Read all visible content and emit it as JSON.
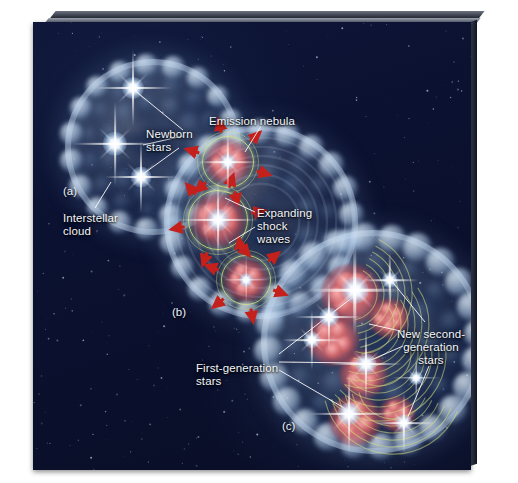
{
  "figure": {
    "background_color": "#0b1130",
    "cloud_color": "#b9d4ee",
    "emission_color": "#d6626a",
    "shockwave_ring_color": "#ced878",
    "arrow_color": "#c4201c",
    "star_color": "#ffffff",
    "label_color": "#f2f6fb"
  },
  "panels": [
    {
      "id": "a",
      "letter": "(a)",
      "x": 30,
      "y": 163
    },
    {
      "id": "b",
      "letter": "(b)",
      "x": 139,
      "y": 284
    },
    {
      "id": "c",
      "letter": "(c)",
      "x": 249,
      "y": 398
    }
  ],
  "labels": [
    {
      "name": "newborn-stars",
      "lines": [
        "Newborn",
        "stars"
      ],
      "x": 113,
      "y": 106,
      "align": "left"
    },
    {
      "name": "interstellar-cloud",
      "lines": [
        "Interstellar",
        "cloud"
      ],
      "x": 30,
      "y": 190,
      "align": "left"
    },
    {
      "name": "emission-nebula",
      "lines": [
        "Emission nebula"
      ],
      "x": 176,
      "y": 93,
      "align": "left"
    },
    {
      "name": "expanding-shock-waves",
      "lines": [
        "Expanding",
        "shock",
        "waves"
      ],
      "x": 224,
      "y": 185,
      "align": "left"
    },
    {
      "name": "first-generation-stars",
      "lines": [
        "First-generation",
        "stars"
      ],
      "x": 163,
      "y": 340,
      "align": "left"
    },
    {
      "name": "new-second-generation-stars",
      "lines": [
        "New second-",
        "generation",
        "stars"
      ],
      "x": 398,
      "y": 306,
      "align": "center"
    }
  ],
  "leader_lines": [
    {
      "from": [
        150,
        108
      ],
      "to": [
        100,
        67
      ],
      "label": "newborn-stars"
    },
    {
      "from": [
        150,
        114
      ],
      "to": [
        110,
        123
      ],
      "label": "newborn-stars"
    },
    {
      "from": [
        146,
        126
      ],
      "to": [
        110,
        152
      ],
      "label": "newborn-stars"
    },
    {
      "from": [
        62,
        186
      ],
      "to": [
        78,
        160
      ],
      "label": "interstellar-cloud"
    },
    {
      "from": [
        228,
        104
      ],
      "to": [
        212,
        130
      ],
      "label": "emission-nebula"
    },
    {
      "from": [
        222,
        190
      ],
      "to": [
        192,
        176
      ],
      "label": "expanding-shock-waves"
    },
    {
      "from": [
        222,
        205
      ],
      "to": [
        196,
        221
      ],
      "label": "expanding-shock-waves"
    },
    {
      "from": [
        246,
        332
      ],
      "to": [
        320,
        275
      ],
      "label": "first-generation-stars"
    },
    {
      "from": [
        246,
        340
      ],
      "to": [
        326,
        341
      ],
      "label": "first-generation-stars"
    },
    {
      "from": [
        246,
        348
      ],
      "to": [
        318,
        390
      ],
      "label": "first-generation-stars"
    },
    {
      "from": [
        392,
        300
      ],
      "to": [
        357,
        257
      ],
      "label": "new-second-generation-stars"
    },
    {
      "from": [
        372,
        310
      ],
      "to": [
        336,
        302
      ],
      "label": "new-second-generation-stars"
    },
    {
      "from": [
        370,
        324
      ],
      "to": [
        338,
        338
      ],
      "label": "new-second-generation-stars"
    },
    {
      "from": [
        396,
        344
      ],
      "to": [
        372,
        402
      ],
      "label": "new-second-generation-stars"
    }
  ],
  "clouds": [
    {
      "id": "cloud-a",
      "cx": 120,
      "cy": 125,
      "r": 88,
      "stage": "interstellar cloud"
    },
    {
      "id": "cloud-b",
      "cx": 228,
      "cy": 200,
      "r": 97,
      "stage": "emission nebula with shock waves"
    },
    {
      "id": "cloud-c",
      "cx": 340,
      "cy": 320,
      "r": 112,
      "stage": "second-generation star formation"
    }
  ],
  "emission_regions": [
    {
      "cx": 195,
      "cy": 140,
      "r": 23
    },
    {
      "cx": 185,
      "cy": 198,
      "r": 27
    },
    {
      "cx": 213,
      "cy": 258,
      "r": 22
    }
  ],
  "shock_arrow_count": 18,
  "stars": {
    "newborn": [
      {
        "cx": 100,
        "cy": 66,
        "size": 38
      },
      {
        "cx": 82,
        "cy": 122,
        "size": 42
      },
      {
        "cx": 108,
        "cy": 155,
        "size": 36
      }
    ],
    "first_generation": [
      {
        "cx": 195,
        "cy": 140,
        "size": 30
      },
      {
        "cx": 185,
        "cy": 198,
        "size": 40
      },
      {
        "cx": 213,
        "cy": 258,
        "size": 24
      }
    ],
    "second_generation": [
      {
        "cx": 322,
        "cy": 268,
        "size": 46
      },
      {
        "cx": 296,
        "cy": 295,
        "size": 34
      },
      {
        "cx": 279,
        "cy": 318,
        "size": 30
      },
      {
        "cx": 333,
        "cy": 342,
        "size": 36
      },
      {
        "cx": 357,
        "cy": 258,
        "size": 28
      },
      {
        "cx": 316,
        "cy": 392,
        "size": 40
      },
      {
        "cx": 371,
        "cy": 401,
        "size": 30
      },
      {
        "cx": 383,
        "cy": 356,
        "size": 24
      }
    ]
  }
}
